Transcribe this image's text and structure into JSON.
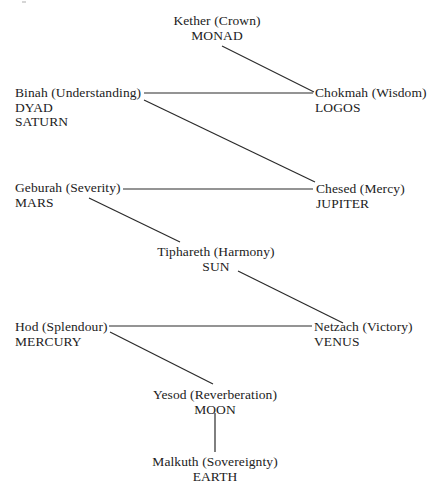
{
  "diagram": {
    "type": "tree-of-life",
    "nodes": [
      {
        "id": "kether",
        "lines": [
          "Kether (Crown)",
          "MONAD"
        ],
        "x": 217,
        "y": 14,
        "align": "center"
      },
      {
        "id": "chokmah",
        "lines": [
          "Chokmah (Wisdom)",
          "LOGOS"
        ],
        "x": 315,
        "y": 86,
        "align": "left"
      },
      {
        "id": "binah",
        "lines": [
          "Binah (Understanding)",
          "DYAD",
          "SATURN"
        ],
        "x": 15,
        "y": 86,
        "align": "left"
      },
      {
        "id": "chesed",
        "lines": [
          "Chesed (Mercy)",
          "JUPITER"
        ],
        "x": 316,
        "y": 182,
        "align": "left"
      },
      {
        "id": "geburah",
        "lines": [
          "Geburah (Severity)",
          "MARS"
        ],
        "x": 15,
        "y": 181,
        "align": "left"
      },
      {
        "id": "tiphareth",
        "lines": [
          "Tiphareth (Harmony)",
          "SUN"
        ],
        "x": 216,
        "y": 245,
        "align": "center"
      },
      {
        "id": "netzach",
        "lines": [
          "Netzach (Victory)",
          "VENUS"
        ],
        "x": 314,
        "y": 320,
        "align": "left"
      },
      {
        "id": "hod",
        "lines": [
          "Hod (Splendour)",
          "MERCURY"
        ],
        "x": 15,
        "y": 320,
        "align": "left"
      },
      {
        "id": "yesod",
        "lines": [
          "Yesod (Reverberation)",
          "MOON"
        ],
        "x": 215,
        "y": 388,
        "align": "center"
      },
      {
        "id": "malkuth",
        "lines": [
          "Malkuth (Sovereignty)",
          "EARTH"
        ],
        "x": 215,
        "y": 455,
        "align": "center"
      }
    ],
    "edges": [
      {
        "from": "kether",
        "to": "chokmah",
        "x1": 222,
        "y1": 46,
        "x2": 314,
        "y2": 92
      },
      {
        "from": "binah",
        "to": "chokmah",
        "x1": 144,
        "y1": 93,
        "x2": 313,
        "y2": 93
      },
      {
        "from": "binah",
        "to": "chesed",
        "x1": 144,
        "y1": 100,
        "x2": 315,
        "y2": 182
      },
      {
        "from": "geburah",
        "to": "chesed",
        "x1": 123,
        "y1": 189,
        "x2": 313,
        "y2": 189
      },
      {
        "from": "geburah",
        "to": "tiphareth",
        "x1": 89,
        "y1": 198,
        "x2": 180,
        "y2": 242
      },
      {
        "from": "tiphareth",
        "to": "netzach",
        "x1": 238,
        "y1": 271,
        "x2": 343,
        "y2": 323
      },
      {
        "from": "hod",
        "to": "netzach",
        "x1": 109,
        "y1": 326,
        "x2": 312,
        "y2": 326
      },
      {
        "from": "hod",
        "to": "yesod",
        "x1": 110,
        "y1": 332,
        "x2": 213,
        "y2": 384
      },
      {
        "from": "yesod",
        "to": "malkuth",
        "x1": 215,
        "y1": 413,
        "x2": 215,
        "y2": 452
      }
    ],
    "colors": {
      "text": "#222222",
      "line": "#2a2a2a",
      "background": "#ffffff"
    }
  }
}
